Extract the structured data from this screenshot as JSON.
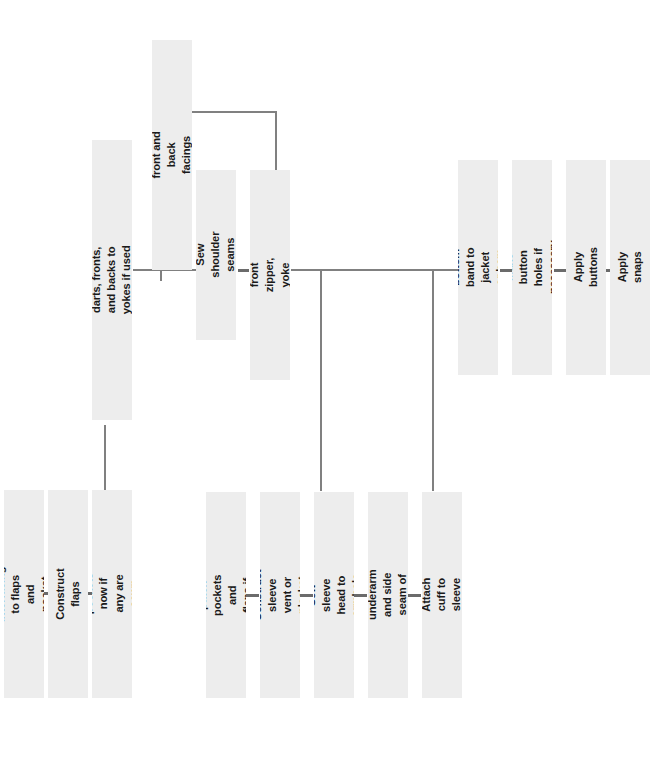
{
  "diagram": {
    "orientation": "text-rotated-90-ccw",
    "colors": {
      "node_fill": "#ededed",
      "connector": "#808080",
      "dash": "#6b6b6b",
      "text": "#1a1a1a",
      "background": "#ffffff"
    },
    "nodes": [
      {
        "id": "apply-interfacing",
        "label": "Apply interfacing to flaps and pocket facings",
        "x": 4,
        "y": 490,
        "w": 40,
        "h": 208
      },
      {
        "id": "construct-flaps",
        "label": "Construct flaps",
        "x": 48,
        "y": 490,
        "w": 40,
        "h": 208
      },
      {
        "id": "apply-flaps-pockets",
        "label": "Apply flaps and/or pockets now if any are sewn into these seams",
        "x": 92,
        "y": 490,
        "w": 40,
        "h": 208
      },
      {
        "id": "sew-princess-seams",
        "label": "Sew princess seams and/or darts, fronts, and backs to yokes if used and add other embellishments",
        "x": 92,
        "y": 140,
        "w": 40,
        "h": 280
      },
      {
        "id": "construct-collar",
        "label": "Construct collar and front and back facings or yoke linings",
        "x": 152,
        "y": 40,
        "w": 40,
        "h": 230
      },
      {
        "id": "sew-shoulder-seams",
        "label": "Sew shoulder seams",
        "x": 196,
        "y": 170,
        "w": 40,
        "h": 170
      },
      {
        "id": "apply-collar-zipper",
        "label": "Apply collar, exposed front zipper, yoke linings, and/or facings.",
        "x": 250,
        "y": 170,
        "w": 40,
        "h": 210
      },
      {
        "id": "add-patch-pockets",
        "label": "Add patch pockets and flaps if used",
        "x": 206,
        "y": 492,
        "w": 40,
        "h": 206
      },
      {
        "id": "construct-sleeve-vent",
        "label": "Construct sleeve vent or placket",
        "x": 260,
        "y": 492,
        "w": 40,
        "h": 206
      },
      {
        "id": "sew-sleeve-head",
        "label": "Sew sleeve head to armhole",
        "x": 314,
        "y": 492,
        "w": 40,
        "h": 206
      },
      {
        "id": "sew-underarm-side-seam",
        "label": "Sew underarm and side seam of jacket",
        "x": 368,
        "y": 492,
        "w": 40,
        "h": 206
      },
      {
        "id": "attach-cuff",
        "label": "Attach cuff to sleeve",
        "x": 422,
        "y": 492,
        "w": 40,
        "h": 206
      },
      {
        "id": "attach-bottom-band",
        "label": "Attach bottom band to jacket or hem jacket",
        "x": 458,
        "y": 160,
        "w": 40,
        "h": 215
      },
      {
        "id": "make-button-holes",
        "label": "Make button holes if necessary",
        "x": 512,
        "y": 160,
        "w": 40,
        "h": 215
      },
      {
        "id": "apply-buttons",
        "label": "Apply buttons",
        "x": 566,
        "y": 160,
        "w": 40,
        "h": 215
      },
      {
        "id": "apply-snaps",
        "label": "Apply snaps",
        "x": 610,
        "y": 160,
        "w": 40,
        "h": 215
      }
    ],
    "connectors": [
      {
        "id": "spine-left",
        "type": "h",
        "x": 133,
        "y": 269,
        "w": 64,
        "h": 2
      },
      {
        "id": "stub-princess-to-spine",
        "type": "v",
        "x": 160,
        "y": 269,
        "w": 2,
        "h": 12
      },
      {
        "id": "elbow-collar-h",
        "type": "h",
        "x": 189,
        "y": 111,
        "w": 88,
        "h": 2
      },
      {
        "id": "elbow-collar-v",
        "type": "v",
        "x": 275,
        "y": 111,
        "w": 2,
        "h": 60
      },
      {
        "id": "spine-right",
        "type": "h",
        "x": 291,
        "y": 269,
        "w": 167,
        "h": 2
      },
      {
        "id": "drop-to-sleeve-col",
        "type": "v",
        "x": 320,
        "y": 269,
        "w": 2,
        "h": 222
      },
      {
        "id": "drop-to-cuff-col",
        "type": "v",
        "x": 432,
        "y": 269,
        "w": 2,
        "h": 222
      },
      {
        "id": "riser-flaps-to-princess",
        "type": "v",
        "x": 104,
        "y": 425,
        "w": 2,
        "h": 66
      }
    ],
    "dashes": [
      {
        "id": "dash-interfacing-flaps",
        "x": 42,
        "y": 592,
        "w": 8
      },
      {
        "id": "dash-flaps-applyflaps",
        "x": 86,
        "y": 592,
        "w": 8
      },
      {
        "id": "dash-shoulder-collar",
        "x": 238,
        "y": 269,
        "w": 11
      },
      {
        "id": "dash-patch-vent",
        "x": 246,
        "y": 594,
        "w": 13
      },
      {
        "id": "dash-vent-sleevehead",
        "x": 300,
        "y": 594,
        "w": 13
      },
      {
        "id": "dash-sleevehead-underarm",
        "x": 354,
        "y": 594,
        "w": 13
      },
      {
        "id": "dash-underarm-cuff",
        "x": 408,
        "y": 594,
        "w": 13
      },
      {
        "id": "dash-band-buttonholes",
        "x": 500,
        "y": 269,
        "w": 13
      },
      {
        "id": "dash-buttonholes-buttons",
        "x": 554,
        "y": 269,
        "w": 13
      },
      {
        "id": "dash-buttons-snaps",
        "x": 599,
        "y": 269,
        "w": 11
      }
    ]
  }
}
